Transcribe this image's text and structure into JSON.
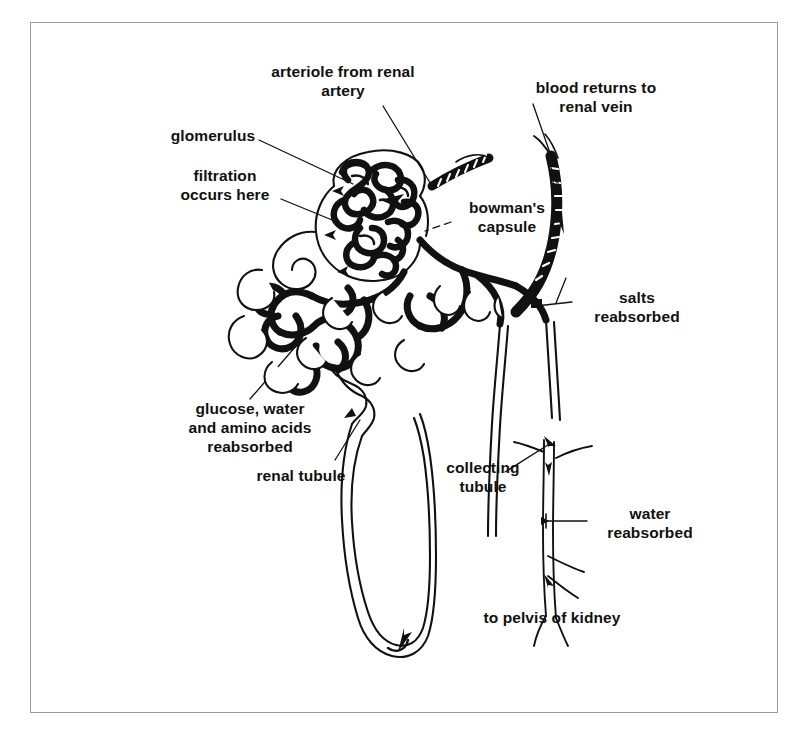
{
  "figure": {
    "background_color": "#ffffff",
    "ink_color": "#111111",
    "border_color": "#9a9a9a"
  },
  "labels": {
    "arteriole": "arteriole from renal\nartery",
    "glomerulus": "glomerulus",
    "filtration": "filtration\noccurs here",
    "bowmans_capsule": "bowman's\ncapsule",
    "blood_returns": "blood returns to\nrenal vein",
    "salts_reabsorbed": "salts\nreabsorbed",
    "glucose_water": "glucose, water\nand amino acids\nreabsorbed",
    "renal_tubule": "renal tubule",
    "collecting_tubule": "collecting\ntubule",
    "water_reabsorbed": "water\nreabsorbed",
    "to_pelvis": "to pelvis of kidney"
  },
  "parts": [
    {
      "name": "glomerulus",
      "description": "dense tangle of capillary loops inside bowman's capsule"
    },
    {
      "name": "bowmans-capsule",
      "description": "rounded cup enclosing the glomerulus"
    },
    {
      "name": "afferent-arteriole",
      "description": "striped vessel entering from upper right"
    },
    {
      "name": "renal-vein",
      "description": "thick dark vessel ascending on the right"
    },
    {
      "name": "proximal-convoluted-tubule",
      "description": "coiled tubule network left of capsule"
    },
    {
      "name": "peritubular-capillaries",
      "description": "dark capillary mesh surrounding tubules"
    },
    {
      "name": "loop-of-henle",
      "description": "long U-shaped thin tubule descending to bottom"
    },
    {
      "name": "collecting-tubule",
      "description": "thin branching duct on the right leading down"
    }
  ]
}
